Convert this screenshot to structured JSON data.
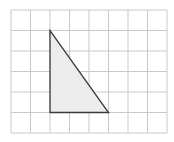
{
  "diagram": {
    "type": "grid-with-triangle",
    "grid": {
      "columns": 8,
      "rows": 6,
      "origin_px": [
        11,
        10
      ],
      "cell_w": 19.5,
      "cell_h": 20.5,
      "line_color": "#c9c9c9"
    },
    "triangle": {
      "vertices_grid": [
        [
          2,
          1
        ],
        [
          2,
          5
        ],
        [
          5,
          5
        ]
      ],
      "fill": "#ececec",
      "stroke": "#3a3a3a",
      "base_units": 3,
      "height_units": 4
    }
  }
}
